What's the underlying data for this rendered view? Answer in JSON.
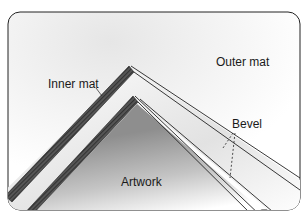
{
  "diagram": {
    "labels": {
      "outer_mat": "Outer mat",
      "inner_mat": "Inner mat",
      "bevel": "Bevel",
      "artwork": "Artwork"
    },
    "colors": {
      "line": "#222222",
      "hatch": "#3a3a3a",
      "artwork_shade": "#9a9a9a",
      "background": "#ffffff"
    }
  }
}
